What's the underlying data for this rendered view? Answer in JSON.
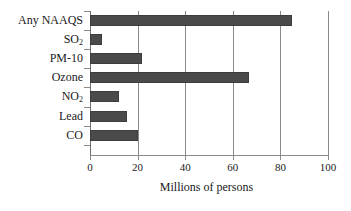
{
  "chart_data": {
    "type": "bar",
    "orientation": "horizontal",
    "title": "",
    "xlabel": "Millions of persons",
    "ylabel": "",
    "categories": [
      "Any NAAQS",
      "SO2",
      "PM-10",
      "Ozone",
      "NO2",
      "Lead",
      "CO"
    ],
    "category_labels_html": [
      "Any NAAQS",
      "SO<sub>2</sub>",
      "PM-10",
      "Ozone",
      "NO<sub>2</sub>",
      "Lead",
      "CO"
    ],
    "values": [
      85,
      5,
      22,
      67,
      12,
      15.5,
      20
    ],
    "xlim": [
      0,
      100
    ],
    "xticks": [
      0,
      20,
      40,
      60,
      80,
      100
    ],
    "xtick_labels": [
      "0",
      "20",
      "40",
      "60",
      "80",
      "100"
    ],
    "grid": "vertical",
    "legend": "none",
    "bar_color": "#4a4a4a",
    "axis_color": "#8a8a8a",
    "gridline_color": "#8b8b8b",
    "text_color": "#1a1a1a",
    "background": "#ffffff"
  }
}
